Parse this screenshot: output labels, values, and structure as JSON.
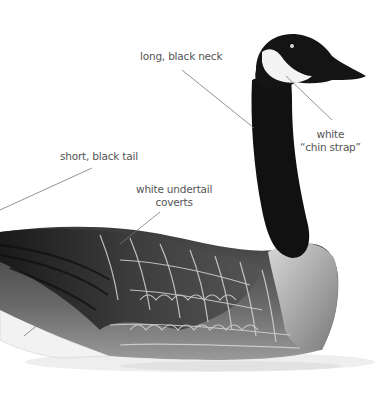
{
  "colors": {
    "background": "#ffffff",
    "label_text": "#555555",
    "leader_line": "#777777",
    "plumage_dark": "#111111",
    "plumage_mid": "#6a6a6a",
    "plumage_light": "#c8c8c8"
  },
  "labels": [
    {
      "id": "neck",
      "text": "long, black neck"
    },
    {
      "id": "chin",
      "line1": "white",
      "line2": "“chin strap”"
    },
    {
      "id": "tail",
      "text": "short, black tail"
    },
    {
      "id": "undertail",
      "line1": "white undertail",
      "line2": "coverts"
    }
  ]
}
